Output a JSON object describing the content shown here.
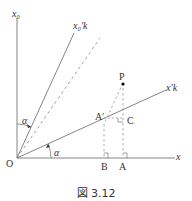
{
  "figure": {
    "caption": "図 3.12",
    "labels": {
      "x_axis": "x",
      "x0_axis": "x₀",
      "x0_prime_k": "x₀′k",
      "x_prime_k": "x′k",
      "origin": "O",
      "point_P": "P",
      "point_A_prime": "A′",
      "point_C": "C",
      "point_B": "B",
      "point_A": "A",
      "angle_upper": "α",
      "angle_lower": "α"
    },
    "colors": {
      "line": "#777777",
      "dashed": "#999999",
      "text": "#333333",
      "point": "#000000"
    }
  }
}
